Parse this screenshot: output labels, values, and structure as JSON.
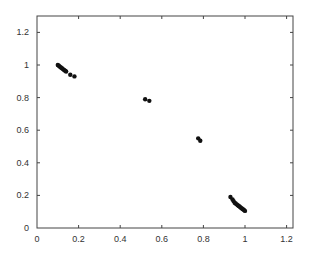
{
  "chart_data": {
    "type": "scatter",
    "title": "",
    "xlabel": "",
    "ylabel": "",
    "xlim": [
      0,
      1.3
    ],
    "ylim": [
      0,
      1.3
    ],
    "grid": false,
    "legend": null,
    "x_ticks": [
      "0",
      "0.2",
      "0.4",
      "0.6",
      "0.8",
      "1",
      "1.2"
    ],
    "y_ticks": [
      "0",
      "0.2",
      "0.4",
      "0.6",
      "0.8",
      "1",
      "1.2"
    ],
    "marker_color": "#111111",
    "series": [
      {
        "name": "points",
        "points": [
          [
            0.1,
            1.0
          ],
          [
            0.105,
            0.995
          ],
          [
            0.11,
            0.99
          ],
          [
            0.115,
            0.985
          ],
          [
            0.12,
            0.98
          ],
          [
            0.125,
            0.975
          ],
          [
            0.13,
            0.97
          ],
          [
            0.135,
            0.965
          ],
          [
            0.14,
            0.96
          ],
          [
            0.16,
            0.94
          ],
          [
            0.18,
            0.93
          ],
          [
            0.52,
            0.79
          ],
          [
            0.54,
            0.78
          ],
          [
            0.775,
            0.55
          ],
          [
            0.785,
            0.535
          ],
          [
            0.93,
            0.19
          ],
          [
            0.94,
            0.175
          ],
          [
            0.945,
            0.165
          ],
          [
            0.95,
            0.155
          ],
          [
            0.955,
            0.15
          ],
          [
            0.96,
            0.145
          ],
          [
            0.965,
            0.14
          ],
          [
            0.97,
            0.135
          ],
          [
            0.975,
            0.13
          ],
          [
            0.98,
            0.125
          ],
          [
            0.985,
            0.12
          ],
          [
            0.99,
            0.115
          ],
          [
            0.995,
            0.11
          ],
          [
            1.0,
            0.105
          ]
        ]
      }
    ]
  }
}
